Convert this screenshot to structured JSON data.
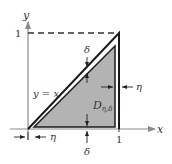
{
  "diagram": {
    "axes": {
      "x_label": "x",
      "y_label": "y",
      "x_tick": "1",
      "y_tick": "1",
      "axis_color": "#8a8a8a"
    },
    "curve_label": "y = x",
    "region_label": "D",
    "region_subscript": "η,δ",
    "delta_label": "δ",
    "eta_label": "η",
    "colors": {
      "shade": "#b3b3b3",
      "outline": "#1a1a1a",
      "dashed": "#333333"
    }
  }
}
